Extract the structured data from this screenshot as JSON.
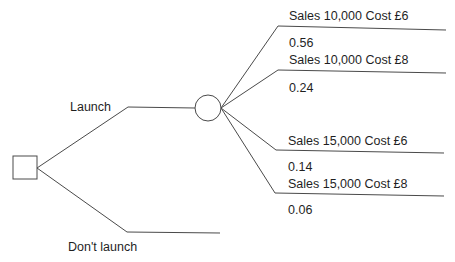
{
  "diagram": {
    "type": "decision-tree",
    "decision_node": {
      "shape": "square"
    },
    "chance_node": {
      "shape": "circle"
    },
    "decisions": [
      {
        "label": "Launch"
      },
      {
        "label": "Don't launch"
      }
    ],
    "outcomes": [
      {
        "label": "Sales 10,000 Cost £6",
        "probability": "0.56"
      },
      {
        "label": "Sales 10,000 Cost £8",
        "probability": "0.24"
      },
      {
        "label": "Sales 15,000 Cost £6",
        "probability": "0.14"
      },
      {
        "label": "Sales 15,000 Cost £8",
        "probability": "0.06"
      }
    ],
    "line_color": "#4a4a4a"
  }
}
